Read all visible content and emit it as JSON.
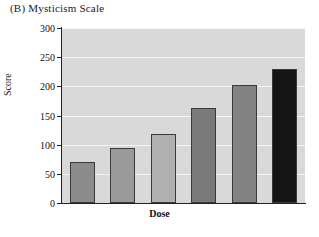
{
  "figure": {
    "panel_label": "(B)",
    "title": "(B)  Mysticism Scale"
  },
  "chart_data": {
    "type": "bar",
    "title": "(B)  Mysticism Scale",
    "xlabel": "Dose",
    "ylabel": "Score",
    "categories": [
      "1",
      "2",
      "3",
      "4",
      "5",
      "6"
    ],
    "values": [
      70,
      94,
      118,
      163,
      203,
      230
    ],
    "ylim": [
      0,
      300
    ],
    "ytick_labels": [
      "0",
      "50",
      "100",
      "150",
      "200",
      "250",
      "300"
    ],
    "ytick_values": [
      0,
      50,
      100,
      150,
      200,
      250,
      300
    ],
    "xtick_labels": [],
    "grid": "horizontal-white",
    "legend": "none",
    "plot_background": "#d9d9d9",
    "bar_colors": [
      "#8c8c8c",
      "#9a9a9a",
      "#b0b0b0",
      "#7a7a7a",
      "#828282",
      "#141414"
    ],
    "bar_edge_color": "#3a3a3a"
  }
}
